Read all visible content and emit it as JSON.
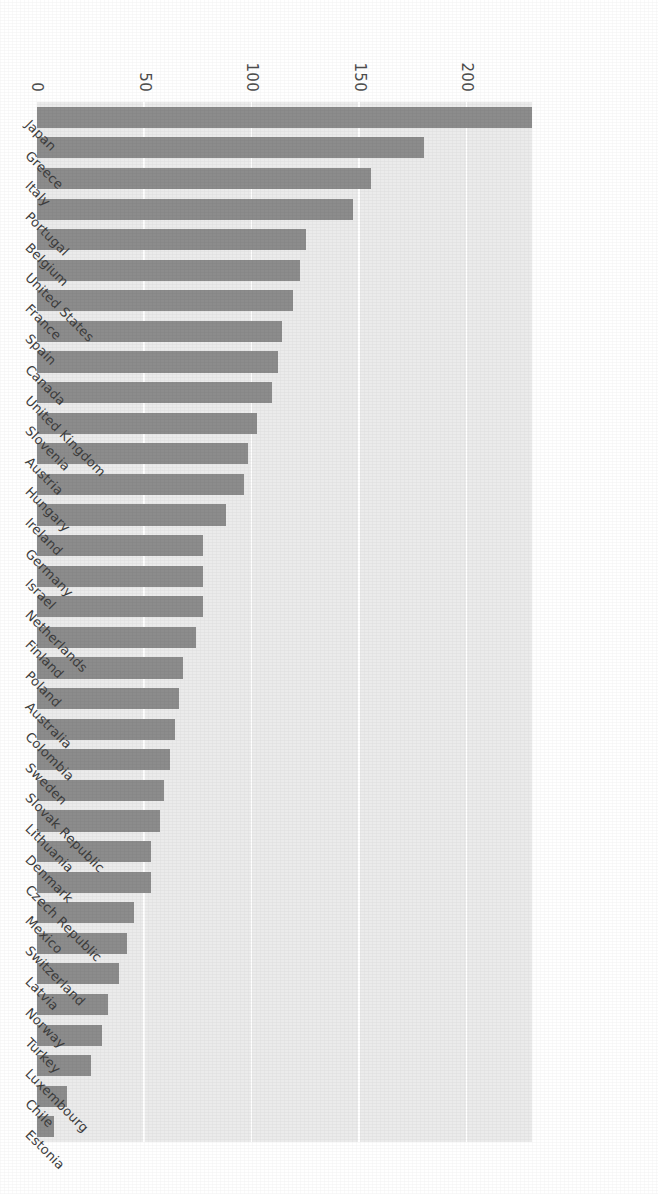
{
  "chart_data": {
    "type": "bar",
    "orientation": "horizontal",
    "title": "",
    "subtitle": "",
    "xlabel": "",
    "ylabel": "",
    "grid": true,
    "legend": null,
    "legend_position": "none",
    "value_axis_range": [
      0,
      230
    ],
    "value_axis_ticks": [
      "0",
      "50",
      "100",
      "150",
      "200"
    ],
    "bar_color": "#8c8c8c",
    "plot_background": "#ebebeb",
    "gridline_color": "#ffffff",
    "categories": [
      "Japan",
      "Greece",
      "Italy",
      "Portugal",
      "Belgium",
      "United States",
      "France",
      "Spain",
      "Canada",
      "United Kingdom",
      "Slovenia",
      "Austria",
      "Hungary",
      "Ireland",
      "Germany",
      "Israel",
      "Netherlands",
      "Finland",
      "Poland",
      "Australia",
      "Colombia",
      "Sweden",
      "Slovak Republic",
      "Lithuania",
      "Denmark",
      "Czech Republic",
      "Mexico",
      "Switzerland",
      "Latvia",
      "Norway",
      "Turkey",
      "Luxembourg",
      "Chile",
      "Estonia"
    ],
    "values": [
      230,
      180,
      155,
      147,
      125,
      122,
      119,
      114,
      112,
      109,
      102,
      98,
      96,
      88,
      77,
      77,
      77,
      74,
      68,
      66,
      64,
      62,
      59,
      57,
      53,
      53,
      45,
      42,
      38,
      33,
      30,
      25,
      14,
      8
    ]
  }
}
